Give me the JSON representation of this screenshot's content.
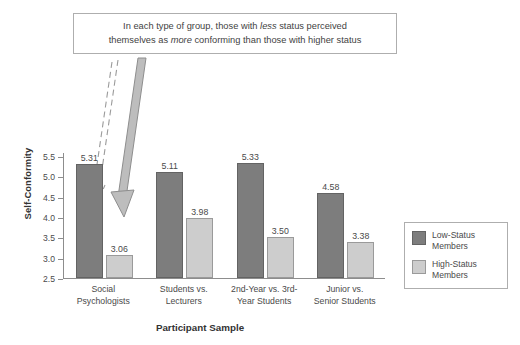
{
  "annotation": {
    "line1_pre": "In each type of group, those with ",
    "line1_em": "less",
    "line1_post": " status perceived",
    "line2_pre": "themselves as ",
    "line2_em": "more",
    "line2_post": " conforming than those with higher status"
  },
  "legend": {
    "items": [
      {
        "label_line1": "Low-Status",
        "label_line2": "Members",
        "color": "#7d7d7d"
      },
      {
        "label_line1": "High-Status",
        "label_line2": "Members",
        "color": "#cdcdcd"
      }
    ]
  },
  "chart_data": {
    "type": "bar",
    "title": "",
    "xlabel": "Participant Sample",
    "ylabel": "Self-Conformity",
    "ylim": [
      2.5,
      5.5
    ],
    "yticks": [
      "5.5",
      "5.0",
      "4.5",
      "4.0",
      "3.5",
      "3.0",
      "2.5"
    ],
    "grid": false,
    "legend_position": "right",
    "categories": [
      "Social Psychologists",
      "Students vs. Lecturers",
      "2nd-Year vs. 3rd-Year Students",
      "Junior vs. Senior Students"
    ],
    "category_lines": [
      [
        "Social",
        "Psychologists"
      ],
      [
        "Students vs.",
        "Lecturers"
      ],
      [
        "2nd-Year vs. 3rd-",
        "Year Students"
      ],
      [
        "Junior vs.",
        "Senior Students"
      ]
    ],
    "series": [
      {
        "name": "Low-Status Members",
        "values": [
          5.31,
          5.11,
          5.33,
          4.58
        ]
      },
      {
        "name": "High-Status Members",
        "values": [
          3.06,
          3.98,
          3.5,
          3.38
        ]
      }
    ],
    "value_labels": [
      [
        "5.31",
        "3.06"
      ],
      [
        "5.11",
        "3.98"
      ],
      [
        "5.33",
        "3.50"
      ],
      [
        "4.58",
        "3.38"
      ]
    ]
  }
}
